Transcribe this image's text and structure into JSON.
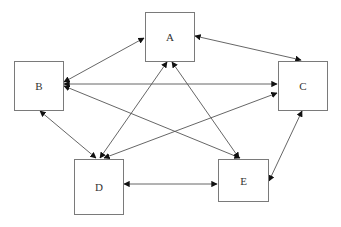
{
  "diagram": {
    "type": "network",
    "nodes": [
      {
        "id": "A",
        "label": "A",
        "x": 145,
        "y": 12,
        "w": 49,
        "h": 49
      },
      {
        "id": "B",
        "label": "B",
        "x": 14,
        "y": 61,
        "w": 49,
        "h": 49
      },
      {
        "id": "C",
        "label": "C",
        "x": 278,
        "y": 61,
        "w": 49,
        "h": 49
      },
      {
        "id": "D",
        "label": "D",
        "x": 74,
        "y": 159,
        "w": 49,
        "h": 55
      },
      {
        "id": "E",
        "label": "E",
        "x": 218,
        "y": 159,
        "w": 50,
        "h": 42
      }
    ],
    "edges": [
      {
        "from": "A",
        "to": "B",
        "direction": "bidirectional"
      },
      {
        "from": "A",
        "to": "C",
        "direction": "bidirectional"
      },
      {
        "from": "B",
        "to": "C",
        "direction": "bidirectional"
      },
      {
        "from": "B",
        "to": "D",
        "direction": "bidirectional"
      },
      {
        "from": "B",
        "to": "E",
        "direction": "bidirectional"
      },
      {
        "from": "A",
        "to": "D",
        "direction": "bidirectional"
      },
      {
        "from": "A",
        "to": "E",
        "direction": "bidirectional"
      },
      {
        "from": "C",
        "to": "D",
        "direction": "bidirectional"
      },
      {
        "from": "D",
        "to": "E",
        "direction": "bidirectional"
      },
      {
        "from": "C",
        "to": "E",
        "direction": "bidirectional"
      }
    ],
    "colors": {
      "line": "#555555",
      "border": "#7a7a7a",
      "text": "#333333"
    }
  }
}
